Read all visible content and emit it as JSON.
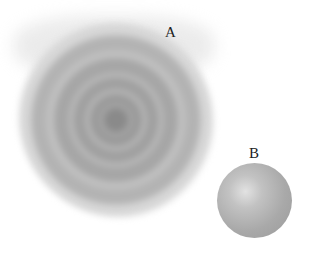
{
  "labels": {
    "a": "A",
    "b": "B"
  },
  "objects": [
    {
      "id": "A",
      "description": "blurred gray concentric-ring blob"
    },
    {
      "id": "B",
      "description": "shaded gray sphere"
    }
  ],
  "colors": {
    "blob": "#a0a0a0",
    "sphere": "#b0b0b0",
    "background": "#ffffff"
  }
}
